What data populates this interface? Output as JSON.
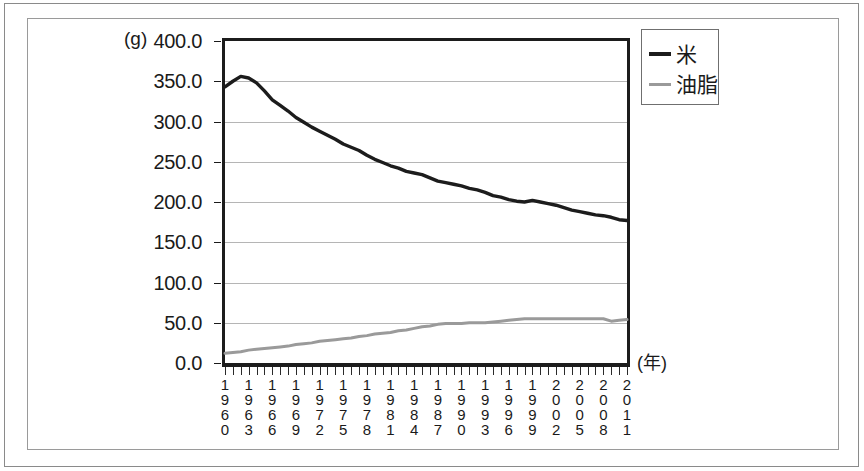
{
  "chart_data": {
    "type": "line",
    "title": "",
    "subtitle": "",
    "xlabel": "(年)",
    "ylabel": "(g)",
    "unit": "(g)",
    "grid": true,
    "legend_position": "top-right",
    "ylim": [
      0,
      400
    ],
    "ytick_step": 50,
    "ytick_labels": [
      "400.0",
      "350.0",
      "300.0",
      "250.0",
      "200.0",
      "150.0",
      "100.0",
      "50.0",
      "0.0"
    ],
    "ytick_values": [
      400,
      350,
      300,
      250,
      200,
      150,
      100,
      50,
      0
    ],
    "xlim": [
      1960,
      2011
    ],
    "xtick_labels": [
      "1960",
      "1963",
      "1966",
      "1969",
      "1972",
      "1975",
      "1978",
      "1981",
      "1984",
      "1987",
      "1990",
      "1993",
      "1996",
      "1999",
      "2002",
      "2005",
      "2008",
      "2011"
    ],
    "x": [
      1960,
      1961,
      1962,
      1963,
      1964,
      1965,
      1966,
      1967,
      1968,
      1969,
      1970,
      1971,
      1972,
      1973,
      1974,
      1975,
      1976,
      1977,
      1978,
      1979,
      1980,
      1981,
      1982,
      1983,
      1984,
      1985,
      1986,
      1987,
      1988,
      1989,
      1990,
      1991,
      1992,
      1993,
      1994,
      1995,
      1996,
      1997,
      1998,
      1999,
      2000,
      2001,
      2002,
      2003,
      2004,
      2005,
      2006,
      2007,
      2008,
      2009,
      2010,
      2011
    ],
    "series": [
      {
        "name": "米",
        "color": "#1c1c1c",
        "width": 3.4,
        "values": [
          343,
          350,
          356,
          354,
          348,
          338,
          327,
          320,
          313,
          305,
          299,
          293,
          288,
          283,
          278,
          272,
          268,
          264,
          258,
          253,
          249,
          245,
          242,
          238,
          236,
          234,
          230,
          226,
          224,
          222,
          220,
          217,
          215,
          212,
          208,
          206,
          203,
          201,
          200,
          202,
          200,
          198,
          196,
          193,
          190,
          188,
          186,
          184,
          183,
          181,
          178,
          177
        ]
      },
      {
        "name": "油脂",
        "color": "#9a9a9a",
        "width": 3.0,
        "values": [
          12,
          13,
          14,
          16,
          17,
          18,
          19,
          20,
          21,
          23,
          24,
          25,
          27,
          28,
          29,
          30,
          31,
          33,
          34,
          36,
          37,
          38,
          40,
          41,
          43,
          45,
          46,
          48,
          49,
          49,
          49,
          50,
          50,
          50,
          51,
          52,
          53,
          54,
          55,
          55,
          55,
          55,
          55,
          55,
          55,
          55,
          55,
          55,
          55,
          52,
          53,
          54
        ]
      }
    ]
  },
  "legend": {
    "items": [
      {
        "label": "米",
        "color": "#1c1c1c"
      },
      {
        "label": "油脂",
        "color": "#9a9a9a"
      }
    ]
  },
  "axes": {
    "y_unit_label": "(g)",
    "x_unit_label": "(年)"
  }
}
